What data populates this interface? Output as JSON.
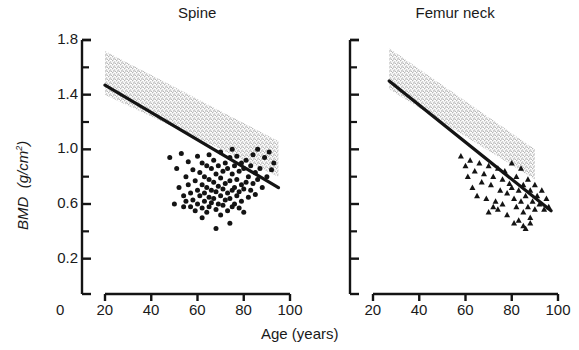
{
  "figure": {
    "xlabel": "Age (years)",
    "ylabel_main": "BMD",
    "ylabel_units": "(g/cm",
    "ylabel_exp": "2",
    "ylabel_close": ")"
  },
  "chart_data": [
    {
      "type": "scatter",
      "title": "Spine",
      "xlabel": "Age (years)",
      "ylabel": "BMD (g/cm2)",
      "xlim": [
        20,
        100
      ],
      "ylim": [
        0.0,
        1.8
      ],
      "xticks": [
        20,
        40,
        60,
        80,
        100
      ],
      "xtick_labels": [
        "20",
        "40",
        "60",
        "80",
        "100"
      ],
      "origin_label": "0",
      "yticks": [
        0.2,
        0.6,
        1.0,
        1.4,
        1.8
      ],
      "ytick_labels": [
        "0.2",
        "0.6",
        "1.0",
        "1.4",
        "1.8"
      ],
      "yminor": [
        0.4,
        0.8,
        1.2,
        1.6
      ],
      "grid": false,
      "legend": "none",
      "marker": "circle",
      "marker_color": "#141414",
      "regression_line": {
        "x": [
          20,
          95
        ],
        "y": [
          1.47,
          0.72
        ],
        "color": "#141414",
        "width": 3.2
      },
      "reference_band": {
        "label": "normal range (stippled)",
        "color": "#c9c9c9",
        "x": [
          20,
          95
        ],
        "upper_y": [
          1.72,
          1.06
        ],
        "lower_y": [
          1.4,
          0.8
        ]
      },
      "points": [
        [
          48,
          0.94
        ],
        [
          50,
          0.6
        ],
        [
          51,
          0.86
        ],
        [
          52,
          0.72
        ],
        [
          53,
          0.97
        ],
        [
          54,
          0.66
        ],
        [
          54,
          0.58
        ],
        [
          55,
          0.8
        ],
        [
          55,
          0.62
        ],
        [
          56,
          0.91
        ],
        [
          56,
          0.74
        ],
        [
          57,
          0.58
        ],
        [
          57,
          0.68
        ],
        [
          58,
          0.85
        ],
        [
          58,
          0.63
        ],
        [
          59,
          0.77
        ],
        [
          59,
          0.55
        ],
        [
          60,
          0.95
        ],
        [
          60,
          0.7
        ],
        [
          60,
          0.6
        ],
        [
          61,
          0.83
        ],
        [
          61,
          0.66
        ],
        [
          62,
          0.9
        ],
        [
          62,
          0.74
        ],
        [
          62,
          0.57
        ],
        [
          63,
          0.8
        ],
        [
          63,
          0.68
        ],
        [
          63,
          0.62
        ],
        [
          64,
          0.88
        ],
        [
          64,
          0.72
        ],
        [
          64,
          0.54
        ],
        [
          65,
          0.96
        ],
        [
          65,
          0.78
        ],
        [
          65,
          0.65
        ],
        [
          65,
          0.58
        ],
        [
          66,
          0.86
        ],
        [
          66,
          0.7
        ],
        [
          66,
          0.61
        ],
        [
          67,
          0.92
        ],
        [
          67,
          0.76
        ],
        [
          67,
          0.64
        ],
        [
          68,
          0.82
        ],
        [
          68,
          0.69
        ],
        [
          68,
          0.56
        ],
        [
          69,
          0.88
        ],
        [
          69,
          0.73
        ],
        [
          69,
          0.6
        ],
        [
          70,
          0.98
        ],
        [
          70,
          0.79
        ],
        [
          70,
          0.66
        ],
        [
          70,
          0.52
        ],
        [
          71,
          0.84
        ],
        [
          71,
          0.71
        ],
        [
          71,
          0.59
        ],
        [
          72,
          0.9
        ],
        [
          72,
          0.75
        ],
        [
          72,
          0.63
        ],
        [
          73,
          0.86
        ],
        [
          73,
          0.68
        ],
        [
          73,
          0.55
        ],
        [
          74,
          0.94
        ],
        [
          74,
          0.77
        ],
        [
          74,
          0.64
        ],
        [
          75,
          1.0
        ],
        [
          75,
          0.82
        ],
        [
          75,
          0.7
        ],
        [
          75,
          0.58
        ],
        [
          76,
          0.88
        ],
        [
          76,
          0.72
        ],
        [
          76,
          0.6
        ],
        [
          77,
          0.95
        ],
        [
          77,
          0.78
        ],
        [
          77,
          0.66
        ],
        [
          78,
          0.84
        ],
        [
          78,
          0.69
        ],
        [
          78,
          0.57
        ],
        [
          79,
          0.9
        ],
        [
          79,
          0.74
        ],
        [
          79,
          0.62
        ],
        [
          80,
          0.86
        ],
        [
          80,
          0.71
        ],
        [
          80,
          0.54
        ],
        [
          81,
          0.92
        ],
        [
          81,
          0.76
        ],
        [
          82,
          0.8
        ],
        [
          82,
          0.65
        ],
        [
          83,
          0.88
        ],
        [
          83,
          0.7
        ],
        [
          84,
          0.96
        ],
        [
          84,
          0.75
        ],
        [
          85,
          0.83
        ],
        [
          85,
          0.67
        ],
        [
          86,
          1.0
        ],
        [
          86,
          0.78
        ],
        [
          87,
          0.86
        ],
        [
          88,
          0.72
        ],
        [
          89,
          0.94
        ],
        [
          90,
          0.8
        ],
        [
          91,
          0.98
        ],
        [
          92,
          0.85
        ],
        [
          93,
          0.9
        ],
        [
          68,
          0.42
        ],
        [
          74,
          0.46
        ],
        [
          62,
          0.5
        ]
      ]
    },
    {
      "type": "scatter",
      "title": "Femur neck",
      "xlabel": "Age (years)",
      "ylabel": "BMD (g/cm2)",
      "xlim": [
        20,
        100
      ],
      "ylim": [
        0.0,
        1.8
      ],
      "xticks": [
        20,
        40,
        60,
        80,
        100
      ],
      "xtick_labels": [
        "20",
        "40",
        "60",
        "80",
        "100"
      ],
      "yticks": [
        0.2,
        0.6,
        1.0,
        1.4,
        1.8
      ],
      "ytick_labels": [
        "0.2",
        "0.6",
        "1.0",
        "1.4",
        "1.8"
      ],
      "yminor": [
        0.4,
        0.8,
        1.2,
        1.6
      ],
      "grid": false,
      "legend": "none",
      "marker": "triangle",
      "marker_color": "#141414",
      "regression_line": {
        "x": [
          27,
          97
        ],
        "y": [
          1.5,
          0.55
        ],
        "color": "#141414",
        "width": 3.2
      },
      "reference_band": {
        "label": "normal range (stippled)",
        "color": "#c9c9c9",
        "x": [
          27,
          90
        ],
        "upper_y": [
          1.74,
          1.0
        ],
        "lower_y": [
          1.44,
          0.78
        ]
      },
      "points": [
        [
          58,
          0.95
        ],
        [
          60,
          0.88
        ],
        [
          61,
          0.8
        ],
        [
          62,
          0.92
        ],
        [
          63,
          0.72
        ],
        [
          64,
          0.84
        ],
        [
          65,
          0.66
        ],
        [
          66,
          0.9
        ],
        [
          67,
          0.76
        ],
        [
          68,
          0.82
        ],
        [
          69,
          0.64
        ],
        [
          70,
          0.88
        ],
        [
          71,
          0.74
        ],
        [
          72,
          0.8
        ],
        [
          73,
          0.62
        ],
        [
          74,
          0.86
        ],
        [
          75,
          0.7
        ],
        [
          76,
          0.78
        ],
        [
          76,
          0.6
        ],
        [
          77,
          0.84
        ],
        [
          78,
          0.68
        ],
        [
          79,
          0.75
        ],
        [
          80,
          0.9
        ],
        [
          80,
          0.72
        ],
        [
          81,
          0.64
        ],
        [
          82,
          0.8
        ],
        [
          82,
          0.58
        ],
        [
          83,
          0.7
        ],
        [
          84,
          0.86
        ],
        [
          84,
          0.62
        ],
        [
          85,
          0.74
        ],
        [
          85,
          0.54
        ],
        [
          86,
          0.66
        ],
        [
          87,
          0.78
        ],
        [
          87,
          0.58
        ],
        [
          88,
          0.7
        ],
        [
          88,
          0.5
        ],
        [
          89,
          0.62
        ],
        [
          90,
          0.74
        ],
        [
          90,
          0.56
        ],
        [
          91,
          0.66
        ],
        [
          92,
          0.6
        ],
        [
          93,
          0.7
        ],
        [
          94,
          0.56
        ],
        [
          95,
          0.64
        ],
        [
          96,
          0.58
        ],
        [
          81,
          0.46
        ],
        [
          83,
          0.48
        ],
        [
          85,
          0.44
        ],
        [
          86,
          0.42
        ],
        [
          88,
          0.46
        ],
        [
          78,
          0.52
        ],
        [
          74,
          0.56
        ],
        [
          72,
          0.58
        ],
        [
          70,
          0.54
        ]
      ]
    }
  ]
}
